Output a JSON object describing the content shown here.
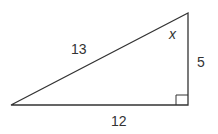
{
  "diagram": {
    "type": "right-triangle",
    "labels": {
      "hypotenuse": "13",
      "vertical_leg": "5",
      "horizontal_leg": "12",
      "angle": "x"
    },
    "right_angle_marker": true,
    "stroke_color": "#333333"
  }
}
